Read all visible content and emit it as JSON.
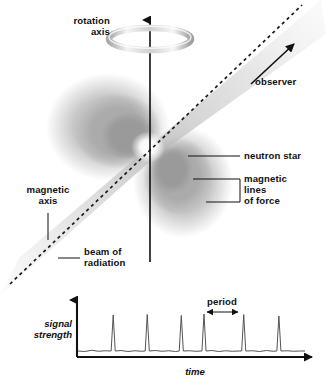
{
  "labels": {
    "rotation_axis_line1": "rotation",
    "rotation_axis_line2": "axis",
    "observer": "observer",
    "neutron_star": "neutron star",
    "magnetic_lines_line1": "magnetic",
    "magnetic_lines_line2": "lines",
    "magnetic_lines_line3": "of force",
    "magnetic_axis_line1": "magnetic",
    "magnetic_axis_line2": "axis",
    "beam_line1": "beam of",
    "beam_line2": "radiation",
    "period": "period",
    "signal_strength_line1": "signal",
    "signal_strength_line2": "strength",
    "time": "time"
  },
  "colors": {
    "background": "#ffffff",
    "text": "#111111",
    "axis": "#111111",
    "trace": "#555555",
    "lobe_outer": "#c9c9c9",
    "lobe_mid": "#b0b0b0",
    "lobe_inner": "#9a9a9a",
    "lobe_core": "#8c8c8c",
    "beam_cone": "#d8d8d8",
    "ring_light": "#f2f2f2",
    "ring_dark": "#9e9e9e",
    "star_glow": "#ffffff"
  },
  "chart_data": {
    "type": "line",
    "title": "",
    "xlabel": "time",
    "ylabel": "signal strength",
    "grid": false,
    "legend": null,
    "xlim": [
      0,
      100
    ],
    "ylim": [
      0,
      10
    ],
    "annotations": [
      {
        "label": "period",
        "type": "double-arrow",
        "x_start": 55,
        "x_end": 73,
        "note": "interval between two successive pulse peaks"
      }
    ],
    "pulse_count": 6,
    "pulse_positions_x": [
      15.5,
      30.5,
      45.5,
      55.5,
      73.0,
      88.5
    ],
    "pulse_peak_values": [
      8.2,
      8.3,
      8.1,
      8.4,
      8.3,
      8.0
    ],
    "baseline_value": 1.0,
    "baseline_noise_amplitude": 0.35,
    "series": [
      {
        "name": "signal strength",
        "x": [
          0,
          3,
          6,
          9,
          12,
          14.6,
          15.5,
          16.4,
          19,
          22,
          25,
          28,
          29.6,
          30.5,
          31.4,
          34,
          37,
          40,
          43,
          44.6,
          45.5,
          46.4,
          49,
          52,
          54.6,
          55.5,
          56.4,
          59,
          62,
          65,
          68,
          71,
          72.1,
          73.0,
          73.9,
          77,
          80,
          83,
          86,
          87.6,
          88.5,
          89.4,
          92,
          95,
          98,
          100
        ],
        "values": [
          1.0,
          0.9,
          1.15,
          0.95,
          1.05,
          1.0,
          8.2,
          1.0,
          1.1,
          0.9,
          1.05,
          0.95,
          1.0,
          8.3,
          1.0,
          1.1,
          0.95,
          1.05,
          0.9,
          1.0,
          8.1,
          1.0,
          1.05,
          0.95,
          1.0,
          8.4,
          1.0,
          1.1,
          0.9,
          1.05,
          0.95,
          1.0,
          1.0,
          8.3,
          1.0,
          1.05,
          0.9,
          1.1,
          0.95,
          1.0,
          8.0,
          1.0,
          1.05,
          0.95,
          1.0,
          1.0
        ]
      }
    ]
  }
}
